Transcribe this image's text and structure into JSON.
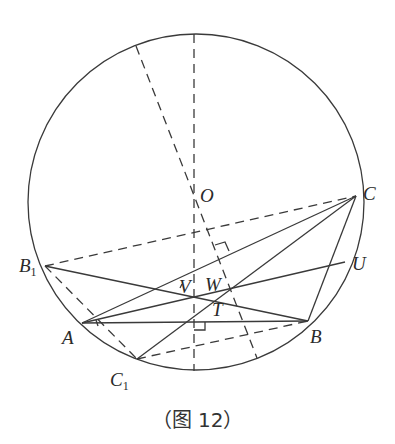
{
  "caption": "（图 12）",
  "points": {
    "O": {
      "label": "O",
      "x": 194,
      "y": 198
    },
    "C": {
      "label": "C",
      "x": 356,
      "y": 196
    },
    "B1": {
      "label": "B",
      "sub": "1",
      "x": 45,
      "y": 266
    },
    "A": {
      "label": "A",
      "x": 82,
      "y": 323
    },
    "B": {
      "label": "B",
      "x": 308,
      "y": 321
    },
    "C1": {
      "label": "C",
      "sub": "1",
      "x": 137,
      "y": 359
    },
    "U": {
      "label": "U",
      "x": 345,
      "y": 262
    },
    "V": {
      "label": "V",
      "x": 194,
      "y": 296
    },
    "W": {
      "label": "W",
      "x": 230,
      "y": 290
    },
    "T": {
      "label": "T",
      "x": 213,
      "y": 302
    }
  },
  "circle": {
    "cx": 196,
    "cy": 202,
    "r": 168
  },
  "stroke_color": "#3a3a3a"
}
